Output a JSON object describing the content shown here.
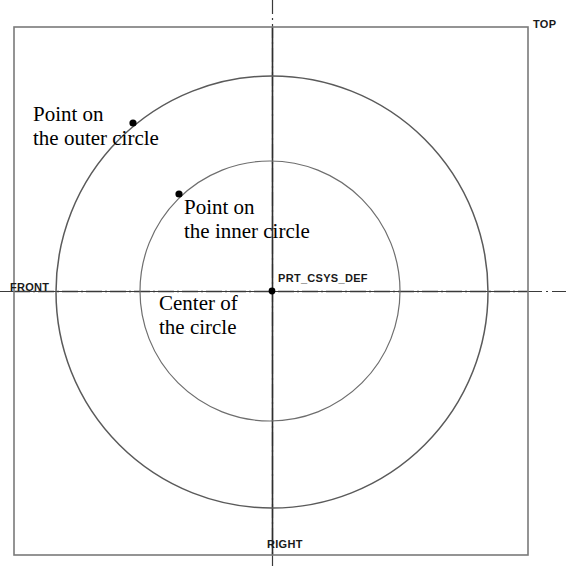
{
  "canvas": {
    "width": 569,
    "height": 570,
    "background": "#ffffff"
  },
  "drawing": {
    "title": "Concentric circles with annotated points",
    "line_color": "#555555",
    "axis_color": "#333333",
    "border_color": "#777777",
    "text_color": "#000000",
    "border": {
      "x": 14,
      "y": 27,
      "width": 514,
      "height": 528
    },
    "center": {
      "x": 272,
      "y": 291
    },
    "circles": [
      {
        "name": "outer-circle",
        "cx": 272,
        "cy": 292,
        "r": 216
      },
      {
        "name": "inner-circle",
        "cx": 270,
        "cy": 291,
        "r": 130
      }
    ],
    "axes": {
      "horizontal": {
        "y": 291,
        "x1": 0,
        "x2": 569,
        "style": "dash-dot"
      },
      "vertical": {
        "x": 272,
        "y1": 0,
        "y2": 570,
        "style": "dash-dot"
      }
    },
    "points": [
      {
        "name": "outer-circle-point",
        "x": 133,
        "y": 123
      },
      {
        "name": "inner-circle-point",
        "x": 179,
        "y": 194
      },
      {
        "name": "center-point",
        "x": 272,
        "y": 291
      }
    ]
  },
  "annotations": {
    "outer_point": "Point on\nthe outer circle",
    "inner_point": "Point on\nthe inner circle",
    "center": "Center of\nthe circle"
  },
  "system_labels": {
    "csys": "PRT_CSYS_DEF",
    "top": "TOP",
    "front": "FRONT",
    "right": "RIGHT"
  }
}
